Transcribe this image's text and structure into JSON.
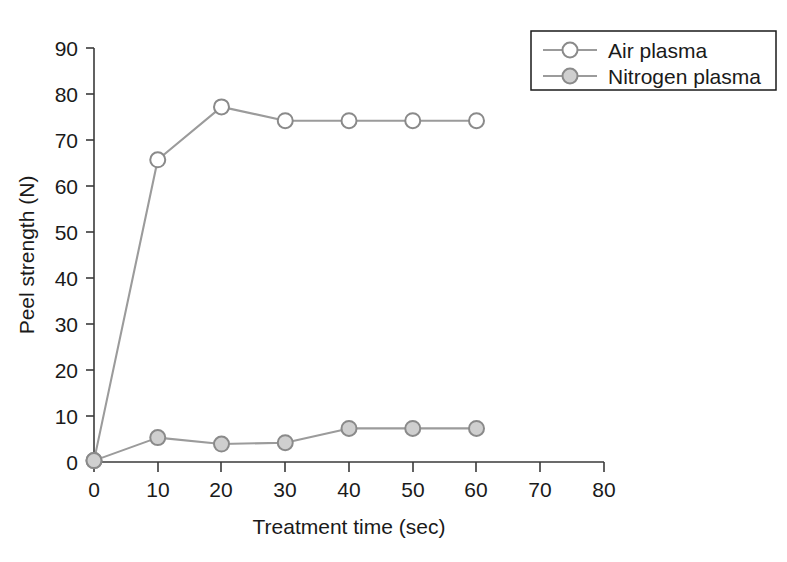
{
  "chart_data": {
    "type": "line",
    "title": "",
    "subtitle": "",
    "xlabel": "Treatment time (sec)",
    "ylabel": "Peel strength (N)",
    "xlim": [
      0,
      80
    ],
    "ylim": [
      0,
      90
    ],
    "xticks": [
      0,
      10,
      20,
      30,
      40,
      50,
      60,
      70,
      80
    ],
    "yticks": [
      0,
      10,
      20,
      30,
      40,
      50,
      60,
      70,
      80,
      90
    ],
    "xtick_labels": [
      "0",
      "10",
      "20",
      "30",
      "40",
      "50",
      "60",
      "70",
      "80"
    ],
    "ytick_labels": [
      "0",
      "10",
      "20",
      "30",
      "40",
      "50",
      "60",
      "70",
      "80",
      "90"
    ],
    "grid": false,
    "legend_position": "top-right",
    "x": [
      0,
      10,
      20,
      30,
      40,
      50,
      60
    ],
    "series": [
      {
        "name": "Air plasma",
        "marker": "open-circle",
        "values": [
          0.3,
          65.7,
          77.2,
          74.2,
          74.2,
          74.2,
          74.2
        ],
        "line_color": "#9b9b9b",
        "marker_fill": "#ffffff",
        "marker_edge": "#8a8a8a"
      },
      {
        "name": "Nitrogen plasma",
        "marker": "filled-circle",
        "values": [
          0.3,
          5.3,
          3.9,
          4.2,
          7.3,
          7.3,
          7.3
        ],
        "line_color": "#9b9b9b",
        "marker_fill": "#cfcfcf",
        "marker_edge": "#8a8a8a"
      }
    ]
  },
  "legend": {
    "entries": [
      {
        "label": "Air plasma"
      },
      {
        "label": "Nitrogen plasma"
      }
    ]
  },
  "axes": {
    "x_title": "Treatment time (sec)",
    "y_title": "Peel strength (N)"
  }
}
